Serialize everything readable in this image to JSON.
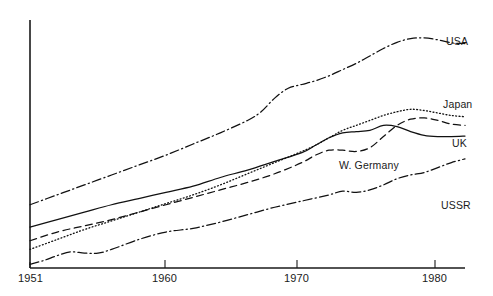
{
  "chart_data": {
    "type": "line",
    "title": "",
    "subtitle": "",
    "xlabel": "",
    "ylabel": "",
    "grid": false,
    "legend_position": "right-inline-end-of-line",
    "x_tick_labels": [
      "1951",
      "1960",
      "1970",
      "1980"
    ],
    "x_tick_values": [
      1951,
      1960,
      1970,
      1980
    ],
    "xlim": [
      1951,
      1983
    ],
    "ylim": [
      0,
      100
    ],
    "y_axis_labeled": false,
    "series": [
      {
        "name": "USA",
        "label": "USA",
        "line_style": "dash-dot",
        "x": [
          1951,
          1953,
          1955,
          1957,
          1959,
          1961,
          1963,
          1965,
          1967,
          1968,
          1969,
          1970,
          1971,
          1972,
          1973,
          1974,
          1975,
          1976,
          1977,
          1978,
          1979,
          1980,
          1981,
          1982,
          1983
        ],
        "values": [
          25.5,
          29.5,
          33.5,
          37.5,
          41.5,
          45.5,
          50.0,
          54.5,
          59.5,
          63.0,
          68.5,
          72.5,
          74.0,
          75.5,
          77.5,
          80.0,
          82.5,
          85.5,
          88.5,
          91.0,
          92.5,
          92.8,
          92.0,
          90.8,
          90.5
        ]
      },
      {
        "name": "Japan",
        "label": "Japan",
        "line_style": "dotted",
        "x": [
          1951,
          1953,
          1955,
          1957,
          1959,
          1961,
          1963,
          1965,
          1967,
          1969,
          1971,
          1972,
          1973,
          1974,
          1975,
          1976,
          1977,
          1978,
          1979,
          1980,
          1981,
          1982,
          1983
        ],
        "values": [
          7.5,
          11.5,
          15.5,
          19.0,
          22.5,
          26.0,
          29.5,
          33.5,
          38.0,
          42.5,
          47.0,
          49.5,
          52.5,
          55.5,
          57.5,
          59.5,
          61.5,
          63.0,
          64.0,
          63.5,
          62.5,
          61.5,
          61.0
        ]
      },
      {
        "name": "UK",
        "label": "UK",
        "line_style": "solid",
        "x": [
          1951,
          1953,
          1955,
          1957,
          1959,
          1961,
          1963,
          1965,
          1967,
          1969,
          1971,
          1972,
          1973,
          1974,
          1975,
          1976,
          1977,
          1978,
          1979,
          1980,
          1981,
          1982,
          1983
        ],
        "values": [
          16.5,
          19.5,
          22.5,
          25.5,
          28.0,
          30.5,
          33.0,
          36.5,
          39.5,
          43.0,
          46.5,
          49.5,
          52.5,
          54.5,
          55.0,
          55.5,
          57.5,
          57.0,
          55.0,
          53.5,
          53.0,
          53.0,
          53.2
        ]
      },
      {
        "name": "W. Germany",
        "label": "W. Germany",
        "line_style": "dashed",
        "x": [
          1951,
          1953,
          1955,
          1957,
          1959,
          1961,
          1963,
          1965,
          1967,
          1969,
          1971,
          1972,
          1973,
          1974,
          1975,
          1976,
          1977,
          1978,
          1979,
          1980,
          1981,
          1982,
          1983
        ],
        "values": [
          11.0,
          14.5,
          17.0,
          19.5,
          22.5,
          25.5,
          28.5,
          31.5,
          34.5,
          38.0,
          42.5,
          45.5,
          47.5,
          47.5,
          47.0,
          48.5,
          53.0,
          57.5,
          60.0,
          60.5,
          59.5,
          58.0,
          57.5
        ]
      },
      {
        "name": "USSR",
        "label": "USSR",
        "line_style": "dash-dot",
        "x": [
          1951,
          1952,
          1953,
          1954,
          1955,
          1956,
          1957,
          1959,
          1961,
          1963,
          1965,
          1967,
          1969,
          1971,
          1973,
          1974,
          1975,
          1976,
          1977,
          1978,
          1979,
          1980,
          1981,
          1982,
          1983
        ],
        "values": [
          1.5,
          3.0,
          5.0,
          6.5,
          6.0,
          6.0,
          7.5,
          11.5,
          14.5,
          16.0,
          18.5,
          21.5,
          24.5,
          27.0,
          29.5,
          31.0,
          30.5,
          31.5,
          33.5,
          36.0,
          37.5,
          38.5,
          40.5,
          42.5,
          44.0
        ]
      }
    ]
  },
  "labels": {
    "usa": "USA",
    "japan": "Japan",
    "uk": "UK",
    "w_germany": "W. Germany",
    "ussr": "USSR"
  },
  "axis": {
    "tick_1951": "1951",
    "tick_1960": "1960",
    "tick_1970": "1970",
    "tick_1980": "1980"
  },
  "colors": {
    "ink": "#111111",
    "axis": "#1a1a1a",
    "background": "#ffffff"
  }
}
